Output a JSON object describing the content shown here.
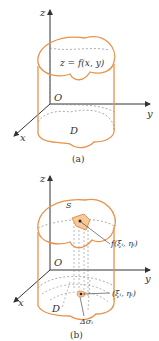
{
  "figure_a": {
    "caption": "(a)",
    "surface_label": "z = f(x, y)",
    "axis_labels": {
      "z": "z",
      "y": "y",
      "x": "x"
    },
    "origin_label": "O",
    "region_label": "D"
  },
  "figure_b": {
    "caption": "(b)",
    "surface_label": "S",
    "axis_labels": {
      "z": "z",
      "y": "y",
      "x": "x"
    },
    "origin_label": "O",
    "region_label": "D",
    "point_value_label": "f(ξᵢ, ηᵢ)",
    "point_label": "(ξᵢ, ηᵢ)",
    "area_element_label": "Δσᵢ"
  },
  "colors": {
    "outline": "#e8924a",
    "axis": "#333333",
    "dashed": "#8a8a8a"
  }
}
